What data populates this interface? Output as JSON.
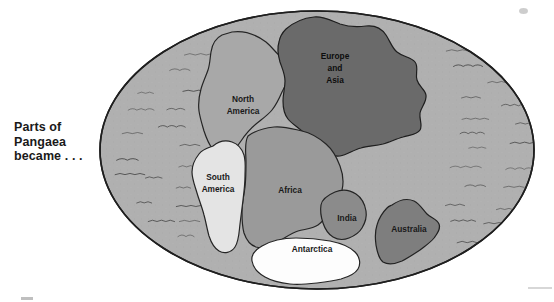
{
  "figure": {
    "name": "pangaea-map",
    "caption_lines": [
      "Parts of",
      "Pangaea",
      "became . . ."
    ],
    "caption_text": "Parts of Pangaea became . . ."
  },
  "map": {
    "shape": "ellipse",
    "ocean_label": "ocean",
    "ocean_color": "#b0b0b0",
    "ocean_wave_mark_color": "#3c3c3c",
    "outline_color": "#1f1f1f",
    "continents": [
      {
        "id": "europe-and-asia",
        "label_lines": [
          "Europe",
          "and",
          "Asia"
        ],
        "label": "Europe and Asia",
        "color": "#6a6a6a"
      },
      {
        "id": "north-america",
        "label_lines": [
          "North",
          "America"
        ],
        "label": "North America",
        "color": "#a8a8a8"
      },
      {
        "id": "south-america",
        "label_lines": [
          "South",
          "America"
        ],
        "label": "South America",
        "color": "#e4e4e4"
      },
      {
        "id": "africa",
        "label_lines": [
          "Africa"
        ],
        "label": "Africa",
        "color": "#9a9a9a"
      },
      {
        "id": "india",
        "label_lines": [
          "India"
        ],
        "label": "India",
        "color": "#8b8b8b"
      },
      {
        "id": "australia",
        "label_lines": [
          "Australia"
        ],
        "label": "Australia",
        "color": "#7e7e7e"
      },
      {
        "id": "antarctica",
        "label_lines": [
          "Antarctica"
        ],
        "label": "Antarctica",
        "color": "#fdfdfd"
      }
    ]
  }
}
